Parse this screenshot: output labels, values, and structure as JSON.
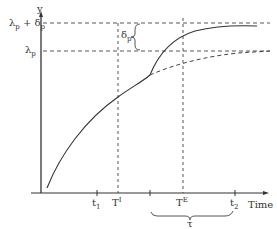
{
  "diagram": {
    "y_axis_label": "y",
    "x_axis_label": "Time",
    "y_labels": {
      "upper": {
        "main": "λ",
        "sub1": "p",
        "plus": " + δ",
        "sub2": "p"
      },
      "lower": {
        "main": "λ",
        "sub": "p"
      }
    },
    "delta_label": {
      "main": "δ",
      "sub": "p"
    },
    "x_ticks": {
      "t1": {
        "main": "t",
        "sub": "1"
      },
      "TI": {
        "main": "T",
        "sup": "I"
      },
      "TE": {
        "main": "T",
        "sup": "E"
      },
      "t2": {
        "main": "t",
        "sub": "2"
      }
    },
    "interval_label": "τ",
    "colors": {
      "line": "#333333",
      "background": "#ffffff"
    }
  }
}
